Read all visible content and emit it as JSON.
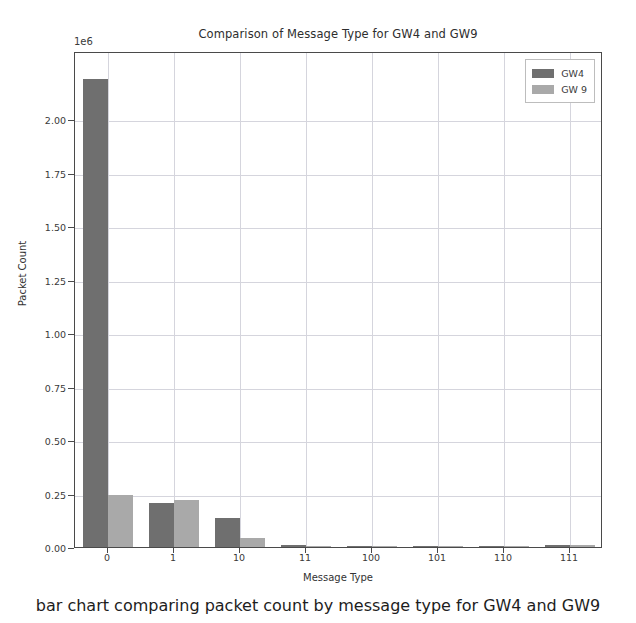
{
  "chart_data": {
    "type": "bar",
    "title": "Comparison of Message Type for GW4 and GW9",
    "xlabel": "Message Type",
    "ylabel": "Packet Count",
    "y_offset_text": "1e6",
    "y_offset_multiplier": 1000000,
    "categories": [
      "0",
      "1",
      "10",
      "11",
      "100",
      "101",
      "110",
      "111"
    ],
    "series": [
      {
        "name": "GW4",
        "color": "#6f6f6f",
        "values": [
          2190000,
          205000,
          137000,
          9000,
          5000,
          4000,
          3000,
          8000
        ]
      },
      {
        "name": "GW 9",
        "color": "#a9a9a9",
        "values": [
          245000,
          218000,
          40000,
          6000,
          4000,
          3000,
          3000,
          11000
        ]
      }
    ],
    "ylim": [
      0,
      2.32
    ],
    "yticks": [
      "0.00",
      "0.25",
      "0.50",
      "0.75",
      "1.00",
      "1.25",
      "1.50",
      "1.75",
      "2.00"
    ],
    "ytick_values": [
      0.0,
      0.25,
      0.5,
      0.75,
      1.0,
      1.25,
      1.5,
      1.75,
      2.0
    ],
    "grid": true,
    "legend_position": "upper right"
  },
  "legend": {
    "entries": [
      {
        "label": "GW4",
        "color": "#6f6f6f",
        "swatch_name": "legend-swatch-gw4"
      },
      {
        "label": "GW 9",
        "color": "#a9a9a9",
        "swatch_name": "legend-swatch-gw9"
      }
    ]
  },
  "caption": {
    "text": "bar chart comparing packet count by message type for GW4 and GW9"
  }
}
